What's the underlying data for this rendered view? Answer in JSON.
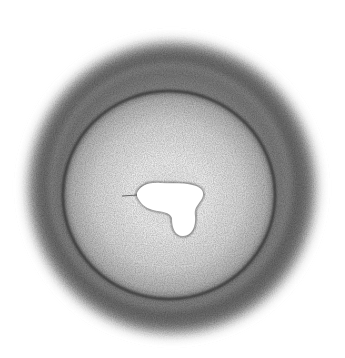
{
  "image": {
    "description": "Grayscale pencil sketch of a circular object with a fuzzy dark outer halo, a darker inner ring, a light interior and a white irregular blob near the center",
    "colors": {
      "background": "#ffffff",
      "halo": "#6e6e6e",
      "ring_edge": "#2a2a2a",
      "interior": "#d8d8d8",
      "blob": "#ffffff",
      "blob_outline": "#222222"
    }
  }
}
